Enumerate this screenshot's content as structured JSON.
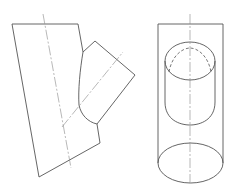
{
  "figure": {
    "views": [
      {
        "name": "side-view",
        "elements": [
          "main-cylinder-outline",
          "branch-cylinder-outline",
          "intersection-curve",
          "centerlines"
        ]
      },
      {
        "name": "front-view",
        "elements": [
          "cylinder-outline",
          "top-ellipse",
          "bottom-ellipse",
          "hidden-intersection-curve",
          "centerline"
        ]
      }
    ],
    "colors": {
      "line": "#555555",
      "centerline": "#888888",
      "background": "#ffffff"
    }
  }
}
